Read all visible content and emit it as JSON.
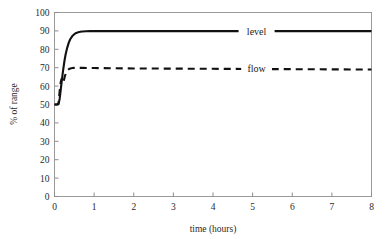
{
  "chart_data": {
    "type": "line",
    "title": "",
    "xlabel": "time (hours)",
    "ylabel": "% of range",
    "xlim": [
      0,
      8
    ],
    "ylim": [
      0,
      100
    ],
    "xticks": [
      0,
      1,
      2,
      3,
      4,
      5,
      6,
      7,
      8
    ],
    "yticks": [
      0,
      10,
      20,
      30,
      40,
      50,
      60,
      70,
      80,
      90,
      100
    ],
    "xtick_labels": [
      "0",
      "1",
      "2",
      "3",
      "4",
      "5",
      "6",
      "7",
      "8"
    ],
    "ytick_labels": [
      "0",
      "10",
      "20",
      "30",
      "40",
      "50",
      "60",
      "70",
      "80",
      "90",
      "100"
    ],
    "grid": false,
    "legend_position": "inline-right",
    "series": [
      {
        "name": "level",
        "style": "solid",
        "color": "#111111",
        "label_x": 5.1,
        "label_y": 89.5,
        "x": [
          0.0,
          0.05,
          0.1,
          0.13,
          0.16,
          0.19,
          0.22,
          0.25,
          0.28,
          0.32,
          0.36,
          0.4,
          0.45,
          0.5,
          0.55,
          0.6,
          0.65,
          0.7,
          0.8,
          0.9,
          1.0,
          1.2,
          1.5,
          2.0,
          2.5,
          3.0,
          3.5,
          4.0,
          4.5,
          5.0,
          5.5,
          6.0,
          6.5,
          7.0,
          7.5,
          8.0
        ],
        "y": [
          50.0,
          50.0,
          50.2,
          53.0,
          58.5,
          64.0,
          69.0,
          73.5,
          77.2,
          80.8,
          83.6,
          85.6,
          87.2,
          88.2,
          88.9,
          89.3,
          89.5,
          89.7,
          89.8,
          89.9,
          89.9,
          89.9,
          89.9,
          89.9,
          89.9,
          89.9,
          89.9,
          89.9,
          89.9,
          89.9,
          89.9,
          89.9,
          89.9,
          89.9,
          89.9,
          89.9
        ]
      },
      {
        "name": "flow",
        "style": "dashed",
        "color": "#111111",
        "label_x": 5.1,
        "label_y": 69.5,
        "x": [
          0.0,
          0.06,
          0.1,
          0.12,
          0.14,
          0.16,
          0.18,
          0.2,
          0.22,
          0.24,
          0.26,
          0.28,
          0.3,
          0.33,
          0.36,
          0.4,
          0.45,
          0.5,
          0.6,
          0.7,
          0.85,
          1.0,
          1.5,
          2.0,
          3.0,
          4.0,
          5.0,
          6.0,
          7.0,
          8.0
        ],
        "y": [
          50.0,
          50.0,
          50.3,
          55.0,
          59.5,
          62.5,
          64.0,
          62.8,
          61.8,
          63.4,
          65.2,
          66.6,
          67.6,
          68.6,
          69.2,
          69.6,
          69.8,
          69.9,
          69.9,
          69.9,
          69.8,
          69.8,
          69.7,
          69.6,
          69.5,
          69.4,
          69.3,
          69.2,
          69.1,
          69.0
        ]
      }
    ]
  }
}
